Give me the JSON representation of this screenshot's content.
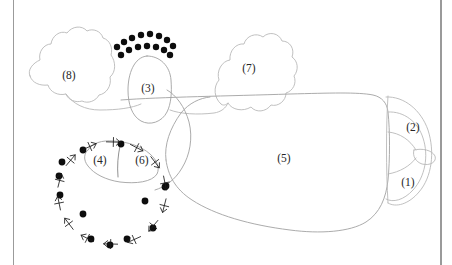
{
  "figure": {
    "background_color": "#ffffff",
    "outline_color": "#b9b9b9",
    "outline_color_dark": "#8b8b8b",
    "dot_color": "#0d0d0d",
    "label_color": "#262626",
    "width": 452,
    "height": 265
  },
  "frame": {
    "left_rule": {
      "x": 13,
      "color": "#9b9b9b",
      "width": 1
    },
    "right_rule": {
      "x": 440,
      "color": "#9a9a9a",
      "width": 2
    }
  },
  "labels": [
    {
      "id": "label-1",
      "text": "(1)",
      "x": 408,
      "y": 183
    },
    {
      "id": "label-2",
      "text": "(2)",
      "x": 413,
      "y": 128
    },
    {
      "id": "label-3",
      "text": "(3)",
      "x": 148,
      "y": 89
    },
    {
      "id": "label-4",
      "text": "(4)",
      "x": 100,
      "y": 161
    },
    {
      "id": "label-5",
      "text": "(5)",
      "x": 284,
      "y": 159
    },
    {
      "id": "label-6",
      "text": "(6)",
      "x": 142,
      "y": 161
    },
    {
      "id": "label-7",
      "text": "(7)",
      "x": 249,
      "y": 69
    },
    {
      "id": "label-8",
      "text": "(8)",
      "x": 69,
      "y": 76
    }
  ],
  "dot_clusters": {
    "upper_arc": {
      "name": "upper-dot-arc",
      "count": 15,
      "points": [
        {
          "x": 117,
          "y": 47
        },
        {
          "x": 124,
          "y": 42
        },
        {
          "x": 132,
          "y": 38
        },
        {
          "x": 141,
          "y": 35
        },
        {
          "x": 150,
          "y": 34
        },
        {
          "x": 159,
          "y": 36
        },
        {
          "x": 167,
          "y": 40
        },
        {
          "x": 173,
          "y": 46
        },
        {
          "x": 121,
          "y": 55
        },
        {
          "x": 129,
          "y": 50
        },
        {
          "x": 138,
          "y": 47
        },
        {
          "x": 147,
          "y": 46
        },
        {
          "x": 156,
          "y": 47
        },
        {
          "x": 164,
          "y": 50
        },
        {
          "x": 170,
          "y": 55
        }
      ]
    },
    "lower_ring": {
      "name": "lower-dot-ring",
      "count": 13,
      "points": [
        {
          "x": 121,
          "y": 144
        },
        {
          "x": 83,
          "y": 150
        },
        {
          "x": 62,
          "y": 162
        },
        {
          "x": 59,
          "y": 176
        },
        {
          "x": 60,
          "y": 195
        },
        {
          "x": 83,
          "y": 214
        },
        {
          "x": 91,
          "y": 239
        },
        {
          "x": 110,
          "y": 245
        },
        {
          "x": 127,
          "y": 239
        },
        {
          "x": 153,
          "y": 228
        },
        {
          "x": 165,
          "y": 187
        },
        {
          "x": 145,
          "y": 201
        },
        {
          "x": 166,
          "y": 186
        }
      ]
    }
  },
  "arrow_marks": {
    "name": "directional-tick-marks",
    "description": "small chevron and cross marks distributed along the lower circular path"
  },
  "regions": [
    {
      "id": "region-8",
      "name": "left-wing-outline"
    },
    {
      "id": "region-7",
      "name": "right-wing-outline"
    },
    {
      "id": "region-3",
      "name": "central-lobe-outline"
    },
    {
      "id": "region-5",
      "name": "main-body-outline"
    },
    {
      "id": "region-4",
      "name": "small-left-lobe-outline"
    },
    {
      "id": "region-6",
      "name": "inner-lobe-outline"
    },
    {
      "id": "region-1",
      "name": "lower-right-arc-outline"
    },
    {
      "id": "region-2",
      "name": "upper-right-arc-outline"
    }
  ]
}
